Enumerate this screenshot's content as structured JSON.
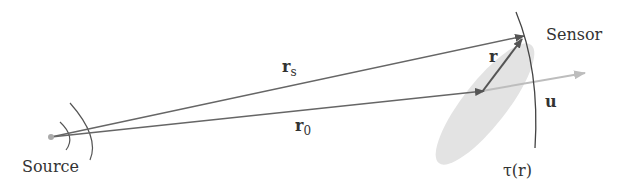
{
  "labels": {
    "source": "Source",
    "sensor": "Sensor",
    "rs_main": "r",
    "rs_sub": "s",
    "r0_main": "r",
    "r0_sub": "0",
    "r": "r",
    "u": "u",
    "tau": "τ(r)"
  },
  "colors": {
    "line": "#666666",
    "arrow_head": "#555555",
    "u_arrow": "#b8b8b8",
    "ellipse": "#e3e3e3",
    "arc": "#444444",
    "text": "#333333"
  }
}
